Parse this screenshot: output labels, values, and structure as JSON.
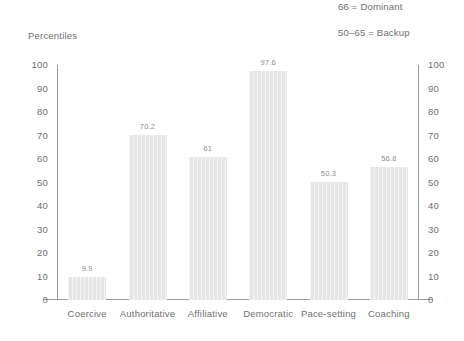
{
  "annotations": [
    {
      "text": "66 = Dominant"
    },
    {
      "text": "50–65 = Backup"
    }
  ],
  "axis_title": "Percentiles",
  "chart_data": {
    "type": "bar",
    "title": "Percentiles",
    "xlabel": "",
    "ylabel": "Percentiles",
    "ylim": [
      0,
      100
    ],
    "yticks": [
      0,
      10,
      20,
      30,
      40,
      50,
      60,
      70,
      80,
      90,
      100
    ],
    "ytick_labels": [
      "0",
      "10",
      "20",
      "30",
      "40",
      "50",
      "60",
      "70",
      "80",
      "90",
      "100"
    ],
    "grid": false,
    "legend": "none",
    "mirrored_y_axis": true,
    "categories": [
      "Coercive",
      "Authoritative",
      "Affiliative",
      "Democratic",
      "Pace-setting",
      "Coaching"
    ],
    "values": [
      9.9,
      70.2,
      61,
      97.6,
      50.3,
      56.8
    ],
    "value_labels": [
      "9.9",
      "70.2",
      "61",
      "97.6",
      "50.3",
      "56.8"
    ],
    "bar_color": "#e6e6e6",
    "axis_color": "#9c9c9c",
    "text_color": "#6f6f6f",
    "annotations": [
      "66 = Dominant",
      "50–65 = Backup"
    ]
  }
}
